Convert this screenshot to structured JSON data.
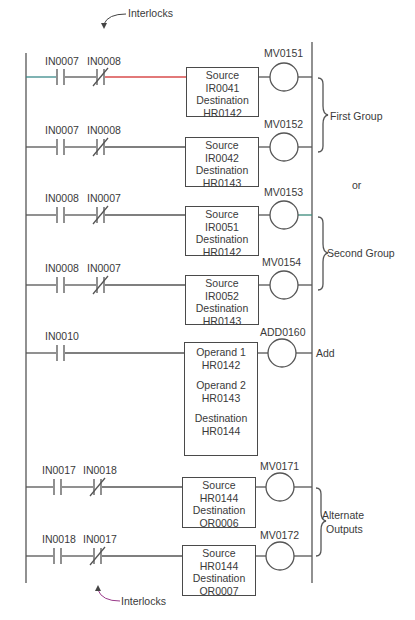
{
  "colors": {
    "line": "#555555",
    "rung1_accent": "#d94c4c",
    "rung1_lead": "#3a8a8a",
    "rung3_accent": "#3a8a7a",
    "interlock_arrow_bottom": "#9a3a8a"
  },
  "annotations": {
    "interlocks_top": "Interlocks",
    "interlocks_bottom": "Interlocks",
    "first_group": "First Group",
    "or": "or",
    "second_group": "Second Group",
    "add": "Add",
    "alternate_outputs_line1": "Alternate",
    "alternate_outputs_line2": "Outputs"
  },
  "rungs": [
    {
      "contact_no": "IN0007",
      "contact_nc": "IN0008",
      "coil": "MV0151",
      "box": [
        "Source",
        "IR0041",
        "Destination",
        "HR0142"
      ]
    },
    {
      "contact_no": "IN0007",
      "contact_nc": "IN0008",
      "coil": "MV0152",
      "box": [
        "Source",
        "IR0042",
        "Destination",
        "HR0143"
      ]
    },
    {
      "contact_no": "IN0008",
      "contact_nc": "IN0007",
      "coil": "MV0153",
      "box": [
        "Source",
        "IR0051",
        "Destination",
        "HR0142"
      ]
    },
    {
      "contact_no": "IN0008",
      "contact_nc": "IN0007",
      "coil": "MV0154",
      "box": [
        "Source",
        "IR0052",
        "Destination",
        "HR0143"
      ]
    },
    {
      "contact_no": "IN0010",
      "coil": "ADD0160",
      "box": [
        "Operand 1",
        "HR0142",
        "Operand 2",
        "HR0143",
        "Destination",
        "HR0144"
      ]
    },
    {
      "contact_no": "IN0017",
      "contact_nc": "IN0018",
      "coil": "MV0171",
      "box": [
        "Source",
        "HR0144",
        "Destination",
        "OR0006"
      ]
    },
    {
      "contact_no": "IN0018",
      "contact_nc": "IN0017",
      "coil": "MV0172",
      "box": [
        "Source",
        "HR0144",
        "Destination",
        "OR0007"
      ]
    }
  ]
}
